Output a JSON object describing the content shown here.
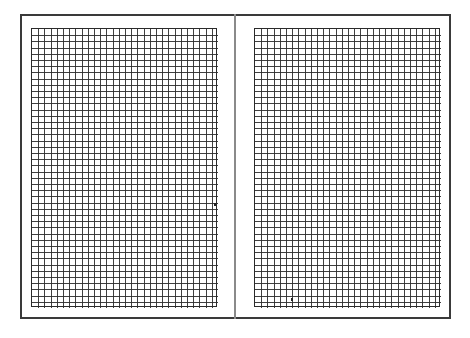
{
  "page": {
    "background": "#ffffff",
    "frame_color": "#3a3a3a",
    "grid_line_color": "#2a2a2a"
  },
  "panels": [
    {
      "name": "left-page",
      "x": 31,
      "y": 28,
      "width": 186,
      "height": 279,
      "columns": 30,
      "rows": 45
    },
    {
      "name": "right-page",
      "x": 254,
      "y": 28,
      "width": 186,
      "height": 279,
      "columns": 30,
      "rows": 45
    }
  ],
  "marks": [
    {
      "name": "stray-mark-left",
      "x": 214,
      "y": 203
    },
    {
      "name": "stray-mark-right",
      "x": 291,
      "y": 298
    }
  ]
}
